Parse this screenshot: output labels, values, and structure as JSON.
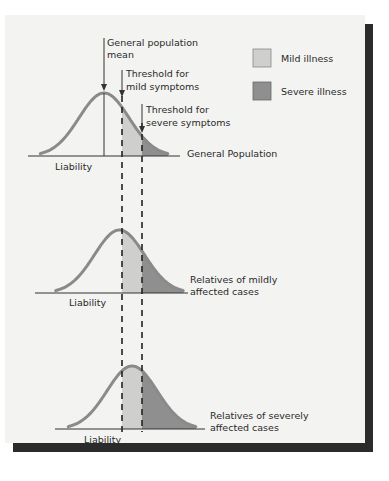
{
  "figure": {
    "colors": {
      "panel_bg": "#f3f3f1",
      "shadow": "#2b2b2b",
      "curve": "#8a8a8a",
      "mild_fill": "#cfcfcd",
      "severe_fill": "#8f8f8f",
      "line": "#333333"
    },
    "annotations": {
      "mean_line1": "General population",
      "mean_line2": "mean",
      "mild_threshold_line1": "Threshold for",
      "mild_threshold_line2": "mild symptoms",
      "severe_threshold_line1": "Threshold for",
      "severe_threshold_line2": "severe symptoms"
    },
    "legend": [
      {
        "label": "Mild illness",
        "color": "#cfcfcd"
      },
      {
        "label": "Severe illness",
        "color": "#8f8f8f"
      }
    ],
    "panels": [
      {
        "axis_label": "Liability",
        "name_line1": "General Population",
        "name_line2": "",
        "mean_shift": 0
      },
      {
        "axis_label": "Liability",
        "name_line1": "Relatives of mildly",
        "name_line2": "affected cases",
        "mean_shift": 0.55
      },
      {
        "axis_label": "Liability",
        "name_line1": "Relatives of severely",
        "name_line2": "affected cases",
        "mean_shift": 1.0
      }
    ],
    "thresholds": {
      "mild_sd": 0.7,
      "severe_sd": 1.45
    }
  }
}
